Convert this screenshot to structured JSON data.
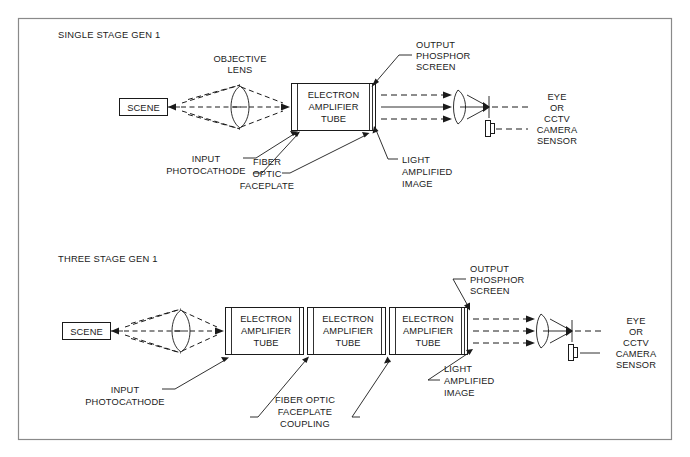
{
  "figure": {
    "background_color": "#ffffff",
    "line_color": "#1a1a1a",
    "frame_color": "#8a8a8a"
  },
  "diagrams": [
    {
      "id": "single-stage",
      "title": "SINGLE STAGE GEN 1",
      "scene_label": "SCENE",
      "tube_label_lines": [
        "ELECTRON",
        "AMPLIFIER",
        "TUBE"
      ],
      "tube_count": 1,
      "labels": {
        "objective_lens": [
          "OBJECTIVE",
          "LENS"
        ],
        "output_phosphor_screen": [
          "OUTPUT",
          "PHOSPHOR",
          "SCREEN"
        ],
        "input_photocathode": [
          "INPUT",
          "PHOTOCATHODE"
        ],
        "fiber_optic_faceplate": [
          "FIBER",
          "OPTIC",
          "FACEPLATE"
        ],
        "light_amplified_image": [
          "LIGHT",
          "AMPLIFIED",
          "IMAGE"
        ],
        "eye_or_cctv": [
          "EYE",
          "OR",
          "CCTV",
          "CAMERA",
          "SENSOR"
        ]
      }
    },
    {
      "id": "three-stage",
      "title": "THREE STAGE GEN 1",
      "scene_label": "SCENE",
      "tube_label_lines": [
        "ELECTRON",
        "AMPLIFIER",
        "TUBE"
      ],
      "tube_count": 3,
      "labels": {
        "output_phosphor_screen": [
          "OUTPUT",
          "PHOSPHOR",
          "SCREEN"
        ],
        "input_photocathode": [
          "INPUT",
          "PHOTOCATHODE"
        ],
        "fiber_optic_faceplate_coupling": [
          "FIBER OPTIC",
          "FACEPLATE",
          "COUPLING"
        ],
        "light_amplified_image": [
          "LIGHT",
          "AMPLIFIED",
          "IMAGE"
        ],
        "eye_or_cctv": [
          "EYE",
          "OR",
          "CCTV",
          "CAMERA",
          "SENSOR"
        ]
      }
    }
  ],
  "text": {
    "t1_title": "SINGLE STAGE GEN 1",
    "t1_scene": "SCENE",
    "t1_obj_1": "OBJECTIVE",
    "t1_obj_2": "LENS",
    "t1_tube_1": "ELECTRON",
    "t1_tube_2": "AMPLIFIER",
    "t1_tube_3": "TUBE",
    "t1_out_1": "OUTPUT",
    "t1_out_2": "PHOSPHOR",
    "t1_out_3": "SCREEN",
    "t1_in_1": "INPUT",
    "t1_in_2": "PHOTOCATHODE",
    "t1_fib_1": "FIBER",
    "t1_fib_2": "OPTIC",
    "t1_fib_3": "FACEPLATE",
    "t1_lit_1": "LIGHT",
    "t1_lit_2": "AMPLIFIED",
    "t1_lit_3": "IMAGE",
    "t1_eye_1": "EYE",
    "t1_eye_2": "OR",
    "t1_eye_3": "CCTV",
    "t1_eye_4": "CAMERA",
    "t1_eye_5": "SENSOR",
    "t2_title": "THREE STAGE GEN 1",
    "t2_scene": "SCENE",
    "t2_tubeA_1": "ELECTRON",
    "t2_tubeA_2": "AMPLIFIER",
    "t2_tubeA_3": "TUBE",
    "t2_tubeB_1": "ELECTRON",
    "t2_tubeB_2": "AMPLIFIER",
    "t2_tubeB_3": "TUBE",
    "t2_tubeC_1": "ELECTRON",
    "t2_tubeC_2": "AMPLIFIER",
    "t2_tubeC_3": "TUBE",
    "t2_out_1": "OUTPUT",
    "t2_out_2": "PHOSPHOR",
    "t2_out_3": "SCREEN",
    "t2_in_1": "INPUT",
    "t2_in_2": "PHOTOCATHODE",
    "t2_fib_1": "FIBER OPTIC",
    "t2_fib_2": "FACEPLATE",
    "t2_fib_3": "COUPLING",
    "t2_lit_1": "LIGHT",
    "t2_lit_2": "AMPLIFIED",
    "t2_lit_3": "IMAGE",
    "t2_eye_1": "EYE",
    "t2_eye_2": "OR",
    "t2_eye_3": "CCTV",
    "t2_eye_4": "CAMERA",
    "t2_eye_5": "SENSOR"
  }
}
